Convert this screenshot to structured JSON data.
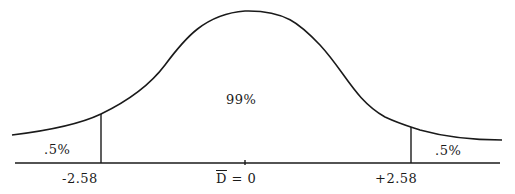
{
  "diagram": {
    "type": "normal-distribution",
    "title": "",
    "center_region": {
      "label": "99%"
    },
    "left_tail_region": {
      "label": ".5%"
    },
    "right_tail_region": {
      "label": ".5%"
    },
    "axis": {
      "left_critical_value": "-2.58",
      "right_critical_value": "+2.58",
      "center_symbol": "D",
      "center_equals": "= 0"
    },
    "colors": {
      "stroke": "#1a1a1a",
      "background": "#ffffff"
    }
  }
}
